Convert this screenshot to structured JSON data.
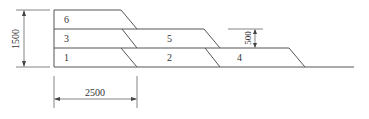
{
  "diagram": {
    "layers": [
      {
        "id": "6",
        "label": "6",
        "x": 64,
        "y": 22
      },
      {
        "id": "3",
        "label": "3",
        "x": 64,
        "y": 41
      },
      {
        "id": "5",
        "label": "5",
        "x": 167,
        "y": 41
      },
      {
        "id": "1",
        "label": "1",
        "x": 64,
        "y": 60
      },
      {
        "id": "2",
        "label": "2",
        "x": 167,
        "y": 60
      },
      {
        "id": "4",
        "label": "4",
        "x": 237,
        "y": 60
      }
    ],
    "dimensions": {
      "total_height": "1500",
      "step_width": "2500",
      "layer_height": "500"
    },
    "colors": {
      "line": "#555555",
      "text": "#333333"
    }
  }
}
